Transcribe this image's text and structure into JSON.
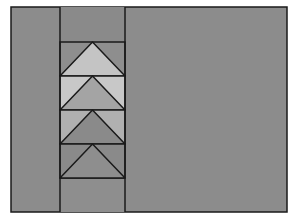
{
  "diagram": {
    "type": "quilt-block",
    "colors": {
      "page_background": "#ffffff",
      "block_background": "#8c8c8c",
      "outline": "#1a1a1a"
    },
    "frame": {
      "x": 11,
      "y": 7,
      "width": 276,
      "height": 205
    },
    "column": {
      "x_left": 60,
      "x_right": 125,
      "top_filler_color": "#8a8a8a",
      "bottom_filler_color": "#8e8e8e"
    },
    "geese": [
      {
        "index": 1,
        "y_top": 42,
        "y_bottom": 76,
        "goose_color": "#c4c4c4",
        "sky_color": "#8e8e8e"
      },
      {
        "index": 2,
        "y_top": 76,
        "y_bottom": 110,
        "goose_color": "#a4a4a4",
        "sky_color": "#c8c8c8"
      },
      {
        "index": 3,
        "y_top": 110,
        "y_bottom": 144,
        "goose_color": "#8a8a8a",
        "sky_color": "#b0b0b0"
      },
      {
        "index": 4,
        "y_top": 144,
        "y_bottom": 178,
        "goose_color": "#8e8e8e",
        "sky_color": "#8a8a8a"
      }
    ]
  }
}
